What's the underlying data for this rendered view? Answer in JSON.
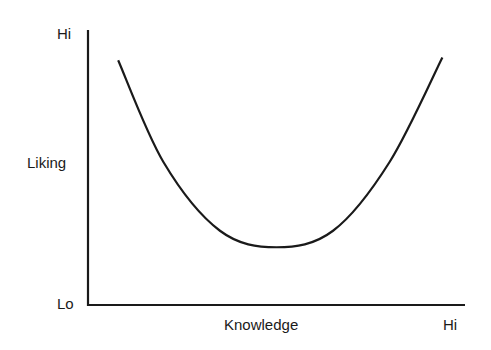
{
  "chart_data": {
    "type": "line",
    "title": "",
    "xlabel": "Knowledge",
    "ylabel": "Liking",
    "x_ticks": {
      "low": "",
      "high": "Hi"
    },
    "y_ticks": {
      "low": "Lo",
      "high": "Hi"
    },
    "origin_label": "Lo",
    "xlim": [
      0,
      1
    ],
    "ylim": [
      0,
      1
    ],
    "grid": false,
    "legend": "none",
    "series": [
      {
        "name": "Liking vs Knowledge",
        "shape": "U-shaped curve",
        "x": [
          0.08,
          0.2,
          0.35,
          0.5,
          0.65,
          0.8,
          0.94
        ],
        "y": [
          0.89,
          0.52,
          0.27,
          0.21,
          0.27,
          0.52,
          0.9
        ]
      }
    ],
    "colors": {
      "line": "#1a1a1a",
      "axis": "#1a1a1a"
    }
  }
}
